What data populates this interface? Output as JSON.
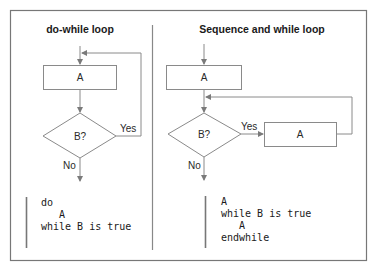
{
  "left": {
    "title": "do-while loop",
    "box_label": "A",
    "decision_label": "B?",
    "yes_label": "Yes",
    "no_label": "No",
    "code": [
      "do",
      "   A",
      "while B is true"
    ]
  },
  "right": {
    "title": "Sequence and while loop",
    "box1_label": "A",
    "decision_label": "B?",
    "yes_label": "Yes",
    "no_label": "No",
    "box2_label": "A",
    "code": [
      "A",
      "while B is true",
      "   A",
      "endwhile"
    ]
  }
}
